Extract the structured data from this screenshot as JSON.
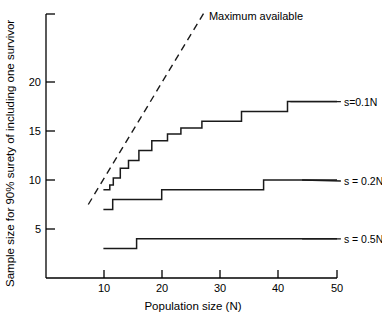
{
  "chart_data": {
    "type": "line",
    "title": "",
    "xlabel": "Population size (N)",
    "ylabel": "Sample size for 90% surety of including one survivor",
    "xlim": [
      0,
      50
    ],
    "ylim": [
      0,
      27
    ],
    "xticks": [
      10,
      20,
      30,
      40,
      50
    ],
    "yticks": [
      5,
      10,
      15,
      20
    ],
    "xtick_labels": [
      "10",
      "20",
      "30",
      "40",
      "50"
    ],
    "ytick_labels": [
      "5",
      "10",
      "15",
      "20"
    ],
    "grid": false,
    "legend_position": "right-inline-labels",
    "annotations": [
      {
        "name": "maximum-available",
        "text": "Maximum available",
        "style": "dashed-line",
        "line_x": [
          7.3,
          27.3
        ],
        "line_y": [
          7.5,
          27.2
        ],
        "label_x": 28.0,
        "label_y": 26.3
      }
    ],
    "series": [
      {
        "name": "s = 0.1N",
        "label": "s=0.1N",
        "style": "step",
        "label_x": 50.5,
        "label_y": 18.0,
        "leader_from_x": 42.0,
        "steps": [
          {
            "x": 9.9,
            "y": 9.0
          },
          {
            "x": 11.0,
            "y": 9.5
          },
          {
            "x": 11.6,
            "y": 10.2
          },
          {
            "x": 12.8,
            "y": 11.2
          },
          {
            "x": 14.2,
            "y": 12.0
          },
          {
            "x": 16.0,
            "y": 13.0
          },
          {
            "x": 18.2,
            "y": 14.0
          },
          {
            "x": 20.9,
            "y": 14.7
          },
          {
            "x": 23.2,
            "y": 15.3
          },
          {
            "x": 26.8,
            "y": 16.0
          },
          {
            "x": 33.6,
            "y": 17.0
          },
          {
            "x": 41.5,
            "y": 18.0
          },
          {
            "x": 50.0,
            "y": 18.0
          }
        ]
      },
      {
        "name": "s = 0.2N",
        "label": "s = 0.2N",
        "style": "step",
        "label_x": 50.5,
        "label_y": 9.9,
        "leader_from_x": 44.0,
        "steps": [
          {
            "x": 9.9,
            "y": 7.0
          },
          {
            "x": 11.5,
            "y": 8.0
          },
          {
            "x": 19.9,
            "y": 9.0
          },
          {
            "x": 37.4,
            "y": 10.0
          },
          {
            "x": 50.0,
            "y": 10.0
          }
        ]
      },
      {
        "name": "s = 0.5N",
        "label": "s = 0.5N",
        "style": "step",
        "label_x": 50.5,
        "label_y": 4.0,
        "leader_from_x": 44.0,
        "steps": [
          {
            "x": 9.9,
            "y": 3.0
          },
          {
            "x": 15.6,
            "y": 4.0
          },
          {
            "x": 50.0,
            "y": 4.0
          }
        ]
      }
    ]
  },
  "axes": {
    "x_title": "Population size (N)",
    "y_title": "Sample size for 90% surety of including one survivor",
    "x_tick_labels": [
      "10",
      "20",
      "30",
      "40",
      "50"
    ],
    "y_tick_labels": [
      "5",
      "10",
      "15",
      "20"
    ]
  },
  "labels": {
    "maximum_available": "Maximum available",
    "series_01": "s=0.1N",
    "series_02": "s = 0.2N",
    "series_05": "s = 0.5N"
  },
  "colors": {
    "ink": "#000000",
    "line": "#1a1a1a",
    "background": "#ffffff"
  }
}
